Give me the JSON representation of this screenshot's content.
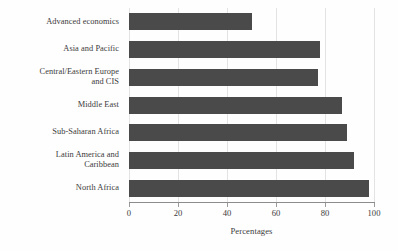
{
  "chart_data": {
    "type": "bar",
    "orientation": "horizontal",
    "title": "",
    "xlabel": "Percentages",
    "ylabel": "",
    "xlim": [
      0,
      100
    ],
    "ylim": null,
    "grid": true,
    "legend": null,
    "bar_color": "#4a4a4a",
    "gridline_color": "#e3e3e3",
    "axis_color": "#8c8c8c",
    "text_color": "#3b3b3b",
    "background_color": "#fefefe",
    "xticks": [
      0,
      20,
      40,
      60,
      80,
      100
    ],
    "xtick_labels": [
      "0",
      "20",
      "40",
      "60",
      "80",
      "100"
    ],
    "categories": [
      "Advanced economics",
      "Asia and Pacific",
      "Central/Eastern Europe\nand CIS",
      "Middle East",
      "Sub-Saharan Africa",
      "Latin America and\nCaribbean",
      "North Africa"
    ],
    "values": [
      50,
      78,
      77,
      87,
      89,
      92,
      98
    ]
  }
}
